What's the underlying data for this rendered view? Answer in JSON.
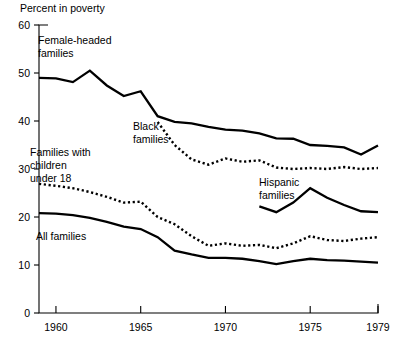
{
  "chart_data": {
    "type": "line",
    "title": "Percent in poverty",
    "xlabel": "",
    "ylabel": "Percent in poverty",
    "xlim": [
      1959,
      1979
    ],
    "ylim": [
      0,
      60
    ],
    "ytick_values": [
      0,
      10,
      20,
      30,
      40,
      50,
      60
    ],
    "ytick_labels": [
      "0",
      "10",
      "20",
      "30",
      "40",
      "50",
      "60"
    ],
    "xtick_values": [
      1960,
      1965,
      1970,
      1975,
      1979
    ],
    "xtick_labels": [
      "1960",
      "1965",
      "1970",
      "1975",
      "1979"
    ],
    "grid": false,
    "legend_position": "inline-annotations",
    "series": [
      {
        "name": "Female-headed families",
        "style": "solid",
        "x": [
          1959,
          1960,
          1961,
          1962,
          1963,
          1964,
          1965,
          1966,
          1967,
          1968,
          1969,
          1970,
          1971,
          1972,
          1973,
          1974,
          1975,
          1976,
          1977,
          1978,
          1979
        ],
        "values": [
          49.0,
          48.9,
          48.1,
          50.5,
          47.4,
          45.2,
          46.2,
          41.0,
          39.8,
          39.5,
          38.8,
          38.2,
          38.0,
          37.4,
          36.4,
          36.3,
          35.0,
          34.8,
          34.5,
          33.0,
          34.9
        ]
      },
      {
        "name": "Black families",
        "style": "dotted",
        "x": [
          1966,
          1967,
          1968,
          1969,
          1970,
          1971,
          1972,
          1973,
          1974,
          1975,
          1976,
          1977,
          1978,
          1979
        ],
        "values": [
          39.8,
          35.0,
          32.0,
          30.9,
          32.2,
          31.5,
          31.8,
          30.3,
          30.0,
          30.2,
          30.0,
          30.4,
          30.0,
          30.2
        ]
      },
      {
        "name": "Families with children under 18",
        "style": "dotted",
        "x": [
          1959,
          1960,
          1961,
          1962,
          1963,
          1964,
          1965,
          1966,
          1967,
          1968,
          1969,
          1970,
          1971,
          1972,
          1973,
          1974,
          1975,
          1976,
          1977,
          1978,
          1979
        ],
        "values": [
          26.9,
          26.5,
          26.0,
          25.2,
          24.2,
          23.0,
          23.2,
          20.0,
          18.5,
          16.0,
          14.0,
          14.5,
          14.0,
          14.2,
          13.5,
          14.5,
          16.0,
          15.2,
          15.0,
          15.5,
          15.8
        ]
      },
      {
        "name": "All families",
        "style": "solid",
        "x": [
          1959,
          1960,
          1961,
          1962,
          1963,
          1964,
          1965,
          1966,
          1967,
          1968,
          1969,
          1970,
          1971,
          1972,
          1973,
          1974,
          1975,
          1976,
          1977,
          1978,
          1979
        ],
        "values": [
          20.8,
          20.7,
          20.4,
          19.8,
          19.0,
          18.0,
          17.5,
          15.8,
          13.0,
          12.2,
          11.5,
          11.5,
          11.3,
          10.8,
          10.2,
          10.8,
          11.3,
          11.0,
          10.9,
          10.7,
          10.5
        ]
      },
      {
        "name": "Hispanic families",
        "style": "solid",
        "x": [
          1972,
          1973,
          1974,
          1975,
          1976,
          1977,
          1978,
          1979
        ],
        "values": [
          22.2,
          21.0,
          23.0,
          26.0,
          24.0,
          22.5,
          21.2,
          21.0
        ]
      }
    ],
    "annotations": [
      {
        "text_lines": [
          "Female-headed",
          "families"
        ],
        "x": 38,
        "y": 44
      },
      {
        "text_lines": [
          "Black",
          "families"
        ],
        "x": 133,
        "y": 130
      },
      {
        "text_lines": [
          "Families with",
          "children",
          "under 18"
        ],
        "x": 30,
        "y": 156
      },
      {
        "text_lines": [
          "Hispanic",
          "families"
        ],
        "x": 259,
        "y": 186
      },
      {
        "text_lines": [
          "All families"
        ],
        "x": 36,
        "y": 240
      }
    ]
  },
  "geometry": {
    "plot_left": 39,
    "plot_right": 378,
    "plot_top": 25,
    "plot_bottom": 313,
    "x_year_min": 1959,
    "x_year_max": 1979,
    "y_min": 0,
    "y_max": 60
  }
}
